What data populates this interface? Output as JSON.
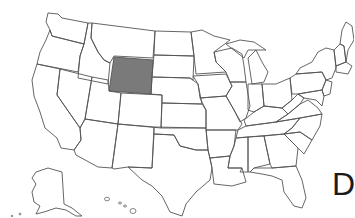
{
  "map": {
    "title": "United States outline map",
    "highlighted_state": "Wyoming",
    "highlight_color": "#7a7a7a",
    "outline_color": "#555555",
    "background_color": "#ffffff"
  },
  "label": {
    "letter": "D"
  }
}
